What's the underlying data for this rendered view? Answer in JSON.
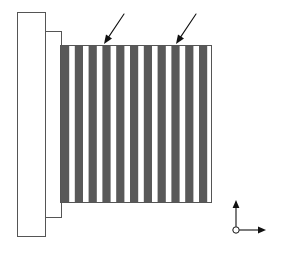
{
  "figure": {
    "title": "Finned tube bundle assembly - side elevation view",
    "background_color": "#ffffff",
    "width": 287,
    "height": 258
  },
  "colors": {
    "fin_dark": "#595959",
    "fin_light": "#ffffff",
    "outline_stroke": "#555555",
    "annotation_stroke": "#111111",
    "page_background": "#ffffff"
  },
  "geometry": {
    "flange_plate": {
      "name": "outer-flange-plate",
      "x": 17,
      "y": 12,
      "width": 28,
      "height": 224
    },
    "spacer_plate": {
      "name": "inner-spacer-plate",
      "x": 45,
      "y": 31,
      "width": 16,
      "height": 186
    },
    "fin_block": {
      "name": "fin-stack-block",
      "x": 60,
      "y": 45,
      "width": 152,
      "height": 158
    }
  },
  "fin_stack": {
    "label": "fin-stack",
    "count_dark_fins": 11,
    "count_gaps": 10,
    "orientation": "vertical",
    "pitch": 13.8,
    "dark_fin_width": 8.2,
    "gap_width": 5.6,
    "top_y": 45,
    "bottom_y": 203,
    "left_x": 60,
    "right_x": 212,
    "dark_fin_left_edges": [
      61.0,
      74.8,
      88.6,
      102.4,
      116.2,
      130.0,
      143.8,
      157.6,
      171.4,
      185.2,
      199.0
    ]
  },
  "annotations": {
    "leaders": [
      {
        "name": "leader-arrow-left",
        "label": "",
        "tail_x": 124,
        "tail_y": 14,
        "tip_x": 104,
        "tip_y": 44,
        "head_angle_deg": 124
      },
      {
        "name": "leader-arrow-right",
        "label": "",
        "tail_x": 196,
        "tail_y": 14,
        "tip_x": 176,
        "tip_y": 44,
        "head_angle_deg": 124
      }
    ]
  },
  "axis_marker": {
    "name": "coordinate-axis-marker",
    "origin_x": 236,
    "origin_y": 230,
    "vertical_length": 30,
    "horizontal_length": 30,
    "origin_radius": 3.2,
    "vertical_label": "",
    "horizontal_label": "",
    "origin_label": ""
  }
}
